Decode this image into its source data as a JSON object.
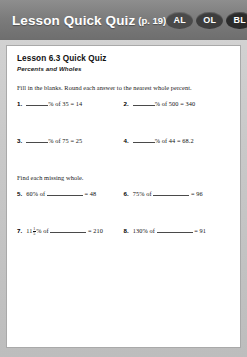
{
  "header": {
    "title": "Lesson Quick Quiz",
    "page_ref": "(p. 19)",
    "badges": [
      {
        "label": "AL",
        "color": "#4a4a4a"
      },
      {
        "label": "OL",
        "color": "#3d3d3d"
      },
      {
        "label": "BL",
        "color": "#2b2b2b"
      }
    ]
  },
  "quiz": {
    "title": "Lesson 6.3 Quick Quiz",
    "subtitle": "Percents and Wholes",
    "section1": {
      "directions": "Fill in the blanks. Round each answer to the nearest whole percent.",
      "problems": [
        {
          "num": "1.",
          "pre": "",
          "post": "% of 35 = 14"
        },
        {
          "num": "2.",
          "pre": "",
          "post": "% of 500 = 340"
        },
        {
          "num": "3.",
          "pre": "",
          "post": "% of 75 = 25"
        },
        {
          "num": "4.",
          "pre": "",
          "post": "% of 44 = 68.2"
        }
      ]
    },
    "section2": {
      "directions": "Find each missing whole.",
      "problems": [
        {
          "num": "5.",
          "pre": "60% of ",
          "post": " = 48"
        },
        {
          "num": "6.",
          "pre": "75% of ",
          "post": " = 96"
        },
        {
          "num": "7.",
          "pre": "11",
          "whole_frac": {
            "numerator": "1",
            "denominator": "5"
          },
          "pre2": "% of ",
          "post": " = 210"
        },
        {
          "num": "8.",
          "pre": "130% of ",
          "post": " = 91"
        }
      ]
    }
  }
}
